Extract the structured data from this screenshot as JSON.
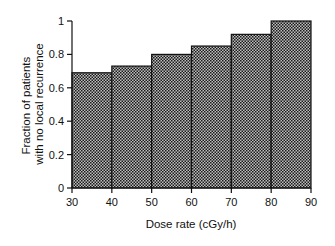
{
  "chart_data": {
    "type": "bar",
    "title": "",
    "xlabel": "Dose rate (cGy/h)",
    "ylabel": "Fraction of patients with no local recurrence",
    "ylabel_lines": [
      "Fraction of patients",
      "with no local recurrence"
    ],
    "bin_edges": [
      30,
      40,
      50,
      60,
      70,
      80,
      90
    ],
    "categories": [
      "30-40",
      "40-50",
      "50-60",
      "60-70",
      "70-80",
      "80-90"
    ],
    "values": [
      0.69,
      0.73,
      0.8,
      0.85,
      0.92,
      1.0
    ],
    "xlim": [
      30,
      90
    ],
    "ylim": [
      0,
      1
    ],
    "xticks": [
      30,
      40,
      50,
      60,
      70,
      80,
      90
    ],
    "yticks": [
      0,
      0.2,
      0.4,
      0.6,
      0.8,
      1
    ],
    "ytick_labels": [
      "0",
      "0.2",
      "0.4",
      "0.6",
      "0.8",
      "1"
    ],
    "grid": false,
    "legend": null,
    "bar_fill": "crosshatch-dark",
    "colors": {
      "bar_dark": "#1a1a1a",
      "bar_light": "#bdbdbd",
      "axis": "#111111"
    }
  }
}
